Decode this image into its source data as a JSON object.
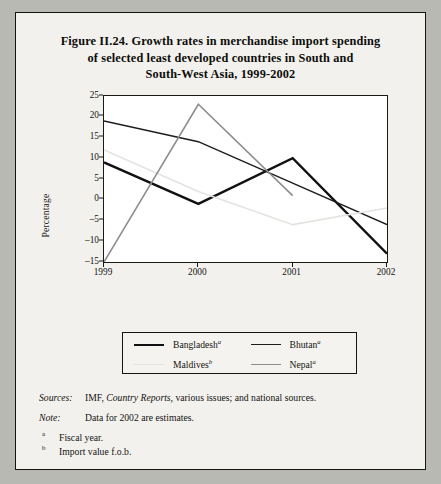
{
  "figure": {
    "title_lines": [
      "Figure II.24.  Growth rates in merchandise import spending",
      "of selected least developed countries in South and",
      "South-West Asia, 1999-2002"
    ]
  },
  "chart_data": {
    "type": "line",
    "title": "Figure II.24.  Growth rates in merchandise import spending of selected least developed countries in South and South-West Asia, 1999-2002",
    "xlabel": "",
    "ylabel": "Percentage",
    "categories": [
      "1999",
      "2000",
      "2001",
      "2002"
    ],
    "x_tick_labels": [
      "1999",
      "2000",
      "2001",
      "2002"
    ],
    "y_tick_labels": [
      "25",
      "20",
      "15",
      "10",
      "5",
      "0",
      "-5",
      "-10",
      "-15"
    ],
    "y_ticks": [
      25,
      20,
      15,
      10,
      5,
      0,
      -5,
      -10,
      -15
    ],
    "ylim": [
      -15,
      25
    ],
    "grid": false,
    "legend_position": "below-plot",
    "series": [
      {
        "name": "Bangladesh",
        "footnote": "a",
        "color": "#111111",
        "width": 2.4,
        "values": [
          9,
          -1,
          10,
          -13
        ]
      },
      {
        "name": "Bhutan",
        "footnote": "a",
        "color": "#1d1d1d",
        "width": 1.5,
        "values": [
          19,
          14,
          4,
          -6
        ]
      },
      {
        "name": "Maldives",
        "footnote": "b",
        "color": "#e4e3e0",
        "width": 1.6,
        "values": [
          12,
          2,
          -6,
          -2
        ]
      },
      {
        "name": "Nepal",
        "footnote": "a",
        "color": "#8d8d8d",
        "width": 1.6,
        "values": [
          -15,
          23,
          1,
          null
        ]
      }
    ]
  },
  "legend": {
    "items": [
      {
        "label": "Bangladesh",
        "sup": "a"
      },
      {
        "label": "Bhutan",
        "sup": "a"
      },
      {
        "label": "Maldives",
        "sup": "b"
      },
      {
        "label": "Nepal",
        "sup": "a"
      }
    ]
  },
  "notes": {
    "sources_lead": "Sources:",
    "sources_pre": "IMF,",
    "sources_italic": "Country Reports,",
    "sources_post": "various issues; and national sources.",
    "note_lead": "Note:",
    "note_text": "Data for 2002 are estimates.",
    "footnotes": [
      {
        "mark": "a",
        "text": "Fiscal year."
      },
      {
        "mark": "b",
        "text": "Import value f.o.b."
      }
    ]
  }
}
